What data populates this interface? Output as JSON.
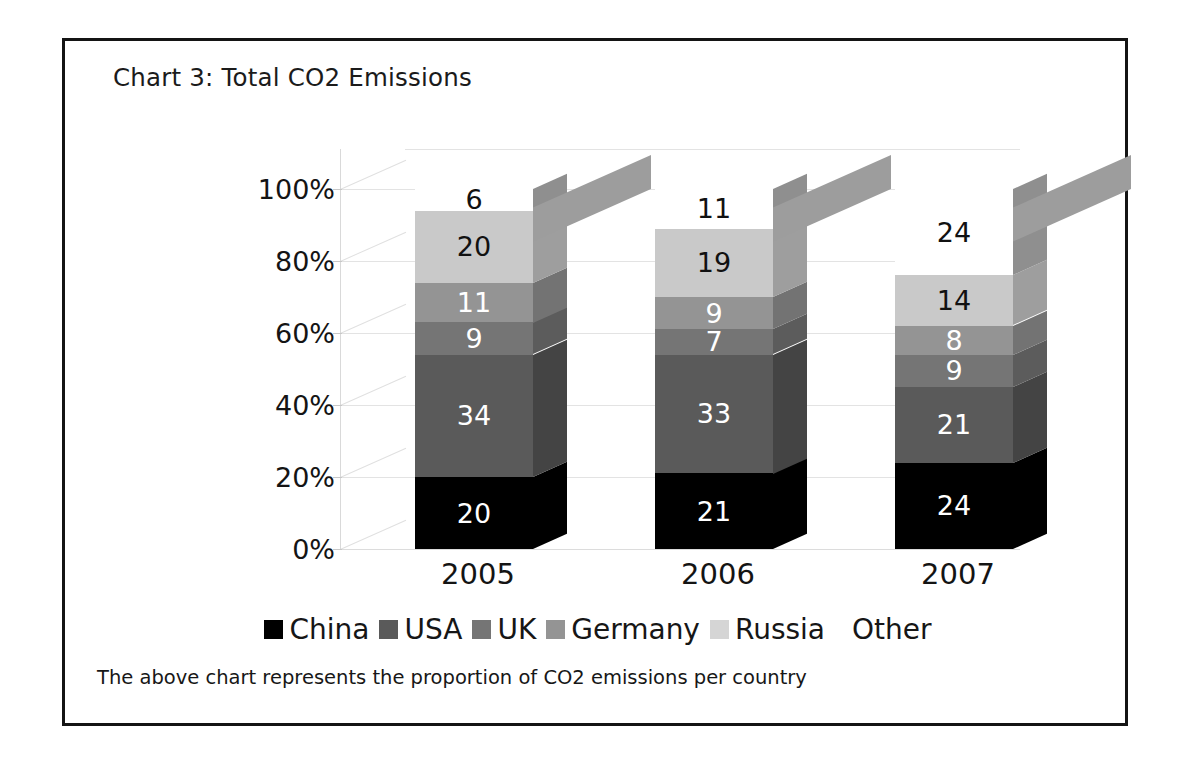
{
  "frame": {
    "border_color": "#141414"
  },
  "title": "Chart 3: Total CO2 Emissions",
  "caption": "The above chart represents the proportion of CO2 emissions per country",
  "chart_data": {
    "type": "bar",
    "subtype": "stacked-percentage-3d-column",
    "title": "Chart 3: Total CO2 Emissions",
    "xlabel": "",
    "ylabel": "",
    "categories": [
      "2005",
      "2006",
      "2007"
    ],
    "ylim": [
      0,
      100
    ],
    "yticks": [
      "0%",
      "20%",
      "40%",
      "60%",
      "80%",
      "100%"
    ],
    "ytick_values": [
      0,
      20,
      40,
      60,
      80,
      100
    ],
    "grid": true,
    "legend_position": "bottom",
    "stack_order_bottom_to_top": [
      "China",
      "USA",
      "UK",
      "Germany",
      "Russia",
      "Other"
    ],
    "series": [
      {
        "name": "China",
        "color": "#000000",
        "side_color": "#000000",
        "values": [
          20,
          21,
          24
        ]
      },
      {
        "name": "USA",
        "color": "#5a5a5a",
        "side_color": "#444444",
        "values": [
          34,
          33,
          21
        ]
      },
      {
        "name": "UK",
        "color": "#757575",
        "side_color": "#5c5c5c",
        "values": [
          9,
          7,
          9
        ]
      },
      {
        "name": "Germany",
        "color": "#949494",
        "side_color": "#737373",
        "values": [
          11,
          9,
          8
        ]
      },
      {
        "name": "Russia",
        "color": "#c9c9c9",
        "side_color": "#9e9e9e",
        "values": [
          20,
          19,
          14
        ]
      },
      {
        "name": "Other",
        "color": "#ffffff",
        "side_color": "#8f8f8f",
        "values": [
          6,
          11,
          24
        ]
      }
    ],
    "bars": [
      {
        "category": "2005",
        "segments": [
          {
            "label": "China",
            "value": 20,
            "value_text": "20"
          },
          {
            "label": "USA",
            "value": 34,
            "value_text": "34"
          },
          {
            "label": "UK",
            "value": 9,
            "value_text": "9"
          },
          {
            "label": "Germany",
            "value": 11,
            "value_text": "11"
          },
          {
            "label": "Russia",
            "value": 20,
            "value_text": "20"
          },
          {
            "label": "Other",
            "value": 6,
            "value_text": "6"
          }
        ]
      },
      {
        "category": "2006",
        "segments": [
          {
            "label": "China",
            "value": 21,
            "value_text": "21"
          },
          {
            "label": "USA",
            "value": 33,
            "value_text": "33"
          },
          {
            "label": "UK",
            "value": 7,
            "value_text": "7"
          },
          {
            "label": "Germany",
            "value": 9,
            "value_text": "9"
          },
          {
            "label": "Russia",
            "value": 19,
            "value_text": "19"
          },
          {
            "label": "Other",
            "value": 11,
            "value_text": "11"
          }
        ]
      },
      {
        "category": "2007",
        "segments": [
          {
            "label": "China",
            "value": 24,
            "value_text": "24"
          },
          {
            "label": "USA",
            "value": 21,
            "value_text": "21"
          },
          {
            "label": "UK",
            "value": 9,
            "value_text": "9"
          },
          {
            "label": "Germany",
            "value": 8,
            "value_text": "8"
          },
          {
            "label": "Russia",
            "value": 14,
            "value_text": "14"
          },
          {
            "label": "Other",
            "value": 24,
            "value_text": "24"
          }
        ]
      }
    ],
    "legend": [
      {
        "label": "China",
        "color": "#000000",
        "has_swatch": true
      },
      {
        "label": "USA",
        "color": "#5a5a5a",
        "has_swatch": true
      },
      {
        "label": "UK",
        "color": "#757575",
        "has_swatch": true
      },
      {
        "label": "Germany",
        "color": "#949494",
        "has_swatch": true
      },
      {
        "label": "Russia",
        "color": "#d5d5d5",
        "has_swatch": true
      },
      {
        "label": "Other",
        "color": "#ffffff",
        "has_swatch": false
      }
    ]
  }
}
